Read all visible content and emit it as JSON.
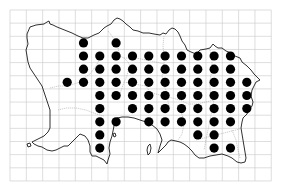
{
  "map": {
    "type": "distribution-grid-map",
    "grid": {
      "x0": 10,
      "y0": 10,
      "cell_width": 16.33,
      "cell_height": 13.15,
      "columns": 16,
      "rows": 13,
      "line_color": "#c8c8c8"
    },
    "dot_color": "#000000",
    "dot_radius": 4.6,
    "occupied_cells": [
      {
        "row": 2,
        "cols": [
          4,
          6
        ]
      },
      {
        "row": 3,
        "cols": [
          4,
          5,
          6,
          7,
          8,
          9,
          10,
          11,
          12,
          13
        ]
      },
      {
        "row": 4,
        "cols": [
          4,
          5,
          6,
          7,
          8,
          9,
          10,
          11,
          12,
          13
        ]
      },
      {
        "row": 5,
        "cols": [
          3,
          4,
          5,
          6,
          7,
          8,
          9,
          10,
          11,
          12,
          13,
          14
        ]
      },
      {
        "row": 6,
        "cols": [
          5,
          6,
          7,
          8,
          9,
          10,
          11,
          12,
          13,
          14
        ]
      },
      {
        "row": 7,
        "cols": [
          5,
          7,
          8,
          9,
          10,
          11,
          12,
          13,
          14
        ]
      },
      {
        "row": 8,
        "cols": [
          5,
          6,
          8,
          9,
          10,
          11,
          12,
          13
        ]
      },
      {
        "row": 9,
        "cols": [
          5,
          11,
          12
        ]
      },
      {
        "row": 10,
        "cols": [
          5,
          12,
          13
        ]
      }
    ]
  }
}
